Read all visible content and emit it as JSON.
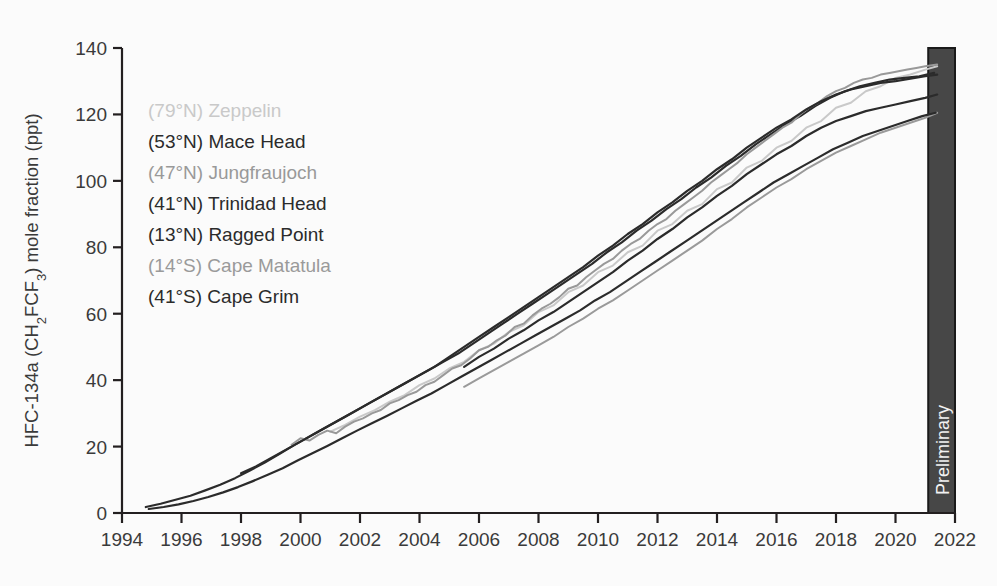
{
  "chart_data": {
    "type": "line",
    "title": "",
    "xlabel": "",
    "ylabel": "HFC-134a (CH2FCF3) mole fraction (ppt)",
    "ylabel_parts": {
      "prefix": "HFC-134a (CH",
      "sub1": "2",
      "mid": "FCF",
      "sub2": "3",
      "suffix": ") mole fraction (ppt)"
    },
    "xlim": [
      1994,
      2022
    ],
    "ylim": [
      0,
      140
    ],
    "grid": false,
    "legend_position": "upper-left-inside",
    "xticks": [
      1994,
      1996,
      1998,
      2000,
      2002,
      2004,
      2006,
      2008,
      2010,
      2012,
      2014,
      2016,
      2018,
      2020,
      2022
    ],
    "yticks": [
      0,
      20,
      40,
      60,
      80,
      100,
      120,
      140
    ],
    "annotations": [
      {
        "name": "preliminary-band",
        "label": "Preliminary",
        "x_start": 2021.1,
        "x_end": 2022.0,
        "color": "#474747",
        "text_color": "#f2f2f2",
        "orientation": "vertical"
      }
    ],
    "series": [
      {
        "name": "Zeppelin",
        "latitude_label": "(79°N)",
        "legend_label": "(79°N) Zeppelin",
        "color": "#c9c9c9",
        "stroke_width": 2.0,
        "x": [
          2001.0,
          2001.5,
          2002.0,
          2002.5,
          2003.0,
          2003.5,
          2004.0,
          2004.5,
          2005.0,
          2005.5,
          2006.0,
          2006.5,
          2007.0,
          2007.5,
          2008.0,
          2008.5,
          2009.0,
          2009.5,
          2010.0,
          2010.5,
          2011.0,
          2011.5,
          2012.0,
          2012.5,
          2013.0,
          2013.5,
          2014.0,
          2014.5,
          2015.0,
          2015.5,
          2016.0,
          2016.5,
          2017.0,
          2017.5,
          2018.0,
          2018.5,
          2019.0,
          2019.5,
          2020.0,
          2020.5,
          2021.0,
          2021.4
        ],
        "y": [
          24.5,
          26.5,
          29.0,
          31.0,
          33.5,
          35.5,
          38.5,
          40.5,
          43.5,
          45.5,
          49.0,
          51.0,
          54.5,
          56.5,
          60.5,
          62.5,
          66.5,
          68.5,
          72.5,
          74.5,
          78.5,
          80.5,
          85.0,
          87.0,
          91.0,
          93.0,
          97.5,
          99.5,
          104.0,
          106.0,
          110.0,
          112.0,
          116.0,
          118.0,
          122.0,
          123.5,
          127.0,
          128.5,
          131.0,
          132.0,
          133.5,
          134.5
        ]
      },
      {
        "name": "Mace Head",
        "latitude_label": "(53°N)",
        "legend_label": "(53°N) Mace Head",
        "color": "#2b2b2b",
        "stroke_width": 2.2,
        "x": [
          1994.8,
          1995.3,
          1995.8,
          1996.3,
          1996.8,
          1997.3,
          1997.8,
          1998.3,
          1998.8,
          1999.3,
          1999.8,
          2000.3,
          2000.8,
          2001.3,
          2001.8,
          2002.3,
          2002.8,
          2003.3,
          2003.8,
          2004.3,
          2004.8,
          2005.3,
          2005.8,
          2006.3,
          2006.8,
          2007.3,
          2007.8,
          2008.3,
          2008.8,
          2009.3,
          2009.8,
          2010.3,
          2010.8,
          2011.3,
          2011.8,
          2012.3,
          2012.8,
          2013.3,
          2013.8,
          2014.3,
          2014.8,
          2015.3,
          2015.8,
          2016.3,
          2016.8,
          2017.3,
          2017.8,
          2018.3,
          2018.8,
          2019.3,
          2019.8,
          2020.3,
          2020.8,
          2021.3
        ],
        "y": [
          1.8,
          2.8,
          4.0,
          5.2,
          6.8,
          8.5,
          10.5,
          12.8,
          15.2,
          17.8,
          20.5,
          23.0,
          25.5,
          28.0,
          30.5,
          33.0,
          35.5,
          38.0,
          40.5,
          43.0,
          45.5,
          48.0,
          51.0,
          54.0,
          57.0,
          60.0,
          63.0,
          66.0,
          69.0,
          72.0,
          75.0,
          78.5,
          81.5,
          85.0,
          88.0,
          91.5,
          94.5,
          98.0,
          101.0,
          104.5,
          107.5,
          111.0,
          114.0,
          117.0,
          119.5,
          122.5,
          125.0,
          127.0,
          128.5,
          129.5,
          130.5,
          131.0,
          131.5,
          132.5
        ]
      },
      {
        "name": "Jungfraujoch",
        "latitude_label": "(47°N)",
        "legend_label": "(47°N) Jungfraujoch",
        "color": "#999999",
        "stroke_width": 2.0,
        "x": [
          1999.7,
          2000.0,
          2000.3,
          2000.6,
          2000.9,
          2001.2,
          2001.5,
          2001.8,
          2002.1,
          2002.4,
          2002.7,
          2003.0,
          2003.3,
          2003.6,
          2003.9,
          2004.2,
          2004.5,
          2004.8,
          2005.1,
          2005.4,
          2005.7,
          2006.0,
          2006.3,
          2006.6,
          2006.9,
          2007.2,
          2007.5,
          2007.8,
          2008.1,
          2008.4,
          2008.7,
          2009.0,
          2009.3,
          2009.6,
          2009.9,
          2010.2,
          2010.5,
          2010.8,
          2011.1,
          2011.4,
          2011.7,
          2012.0,
          2012.3,
          2012.6,
          2012.9,
          2013.2,
          2013.5,
          2013.8,
          2014.1,
          2014.4,
          2014.7,
          2015.0,
          2015.3,
          2015.6,
          2015.9,
          2016.2,
          2016.5,
          2016.8,
          2017.1,
          2017.4,
          2017.7,
          2018.0,
          2018.3,
          2018.6,
          2018.9,
          2019.2,
          2019.5,
          2019.8,
          2020.1,
          2020.4,
          2020.7,
          2021.0,
          2021.4
        ],
        "y": [
          20.5,
          22.5,
          21.8,
          23.5,
          24.8,
          24.0,
          26.0,
          27.5,
          28.5,
          30.0,
          31.0,
          33.0,
          34.0,
          35.5,
          36.5,
          38.5,
          39.5,
          41.5,
          43.5,
          44.5,
          46.5,
          49.0,
          50.0,
          52.0,
          53.5,
          56.0,
          57.0,
          59.5,
          61.5,
          63.0,
          65.0,
          67.5,
          68.5,
          71.0,
          73.0,
          75.0,
          76.5,
          79.0,
          81.0,
          82.5,
          85.0,
          87.0,
          88.5,
          91.0,
          93.0,
          95.0,
          97.0,
          99.5,
          101.5,
          103.5,
          105.5,
          108.0,
          110.0,
          112.0,
          114.0,
          116.0,
          117.5,
          120.0,
          122.0,
          123.5,
          125.5,
          127.0,
          128.0,
          129.5,
          130.5,
          131.0,
          132.0,
          132.5,
          133.0,
          133.5,
          134.0,
          134.5,
          135.0
        ]
      },
      {
        "name": "Trinidad Head",
        "latitude_label": "(41°N)",
        "legend_label": "(41°N) Trinidad Head",
        "color": "#2b2b2b",
        "stroke_width": 2.2,
        "x": [
          1998.0,
          1998.5,
          1999.0,
          1999.5,
          2000.0,
          2000.5,
          2001.0,
          2001.5,
          2002.0,
          2002.5,
          2003.0,
          2003.5,
          2004.0,
          2004.5,
          2005.0,
          2005.5,
          2006.0,
          2006.5,
          2007.0,
          2007.5,
          2008.0,
          2008.5,
          2009.0,
          2009.5,
          2010.0,
          2010.5,
          2011.0,
          2011.5,
          2012.0,
          2012.5,
          2013.0,
          2013.5,
          2014.0,
          2014.5,
          2015.0,
          2015.5,
          2016.0,
          2016.5,
          2017.0,
          2017.5,
          2018.0,
          2018.5,
          2019.0,
          2019.5,
          2020.0,
          2020.5,
          2021.0,
          2021.4
        ],
        "y": [
          12.0,
          14.0,
          16.5,
          19.0,
          21.5,
          24.0,
          26.5,
          29.0,
          31.5,
          34.0,
          36.5,
          39.0,
          41.5,
          44.0,
          47.0,
          50.0,
          53.0,
          56.0,
          59.0,
          62.0,
          65.0,
          68.0,
          71.0,
          74.0,
          77.5,
          80.5,
          84.0,
          87.0,
          90.5,
          93.5,
          97.0,
          100.0,
          103.5,
          106.5,
          110.0,
          113.0,
          116.0,
          118.5,
          121.5,
          124.0,
          126.0,
          127.5,
          128.5,
          129.5,
          130.0,
          130.8,
          131.5,
          132.0
        ]
      },
      {
        "name": "Ragged Point",
        "latitude_label": "(13°N)",
        "legend_label": "(13°N) Ragged Point",
        "color": "#2b2b2b",
        "stroke_width": 2.2,
        "x": [
          2005.5,
          2006.0,
          2006.5,
          2007.0,
          2007.5,
          2008.0,
          2008.5,
          2009.0,
          2009.5,
          2010.0,
          2010.5,
          2011.0,
          2011.5,
          2012.0,
          2012.5,
          2013.0,
          2013.5,
          2014.0,
          2014.5,
          2015.0,
          2015.5,
          2016.0,
          2016.5,
          2017.0,
          2017.5,
          2018.0,
          2018.5,
          2019.0,
          2019.5,
          2020.0,
          2020.5,
          2021.0,
          2021.4
        ],
        "y": [
          44.0,
          47.0,
          49.5,
          52.5,
          55.0,
          58.0,
          60.5,
          63.5,
          66.5,
          69.5,
          72.5,
          76.0,
          79.0,
          82.5,
          85.5,
          89.0,
          92.0,
          95.5,
          98.5,
          102.0,
          105.0,
          108.0,
          110.5,
          113.5,
          116.0,
          118.0,
          119.5,
          121.0,
          122.0,
          123.0,
          124.0,
          125.0,
          126.0
        ]
      },
      {
        "name": "Cape Matatula",
        "latitude_label": "(14°S)",
        "legend_label": "(14°S) Cape Matatula",
        "color": "#9a9a9a",
        "stroke_width": 2.0,
        "x": [
          2005.5,
          2006.0,
          2006.5,
          2007.0,
          2007.5,
          2008.0,
          2008.5,
          2009.0,
          2009.5,
          2010.0,
          2010.5,
          2011.0,
          2011.5,
          2012.0,
          2012.5,
          2013.0,
          2013.5,
          2014.0,
          2014.5,
          2015.0,
          2015.5,
          2016.0,
          2016.5,
          2017.0,
          2017.5,
          2018.0,
          2018.5,
          2019.0,
          2019.5,
          2020.0,
          2020.5,
          2021.0,
          2021.4
        ],
        "y": [
          38.0,
          40.5,
          43.0,
          45.5,
          48.0,
          50.5,
          53.0,
          56.0,
          58.5,
          61.5,
          64.0,
          67.0,
          70.0,
          73.0,
          76.0,
          79.0,
          82.0,
          85.5,
          88.5,
          92.0,
          95.0,
          98.0,
          100.5,
          103.5,
          106.0,
          108.5,
          110.5,
          112.5,
          114.5,
          116.0,
          117.5,
          119.0,
          120.5
        ]
      },
      {
        "name": "Cape Grim",
        "latitude_label": "(41°S)",
        "legend_label": "(41°S) Cape Grim",
        "color": "#2b2b2b",
        "stroke_width": 2.2,
        "x": [
          1994.9,
          1995.4,
          1995.9,
          1996.4,
          1996.9,
          1997.4,
          1997.9,
          1998.4,
          1998.9,
          1999.4,
          1999.9,
          2000.4,
          2000.9,
          2001.4,
          2001.9,
          2002.4,
          2002.9,
          2003.4,
          2003.9,
          2004.4,
          2004.9,
          2005.4,
          2005.9,
          2006.4,
          2006.9,
          2007.4,
          2007.9,
          2008.4,
          2008.9,
          2009.4,
          2009.9,
          2010.4,
          2010.9,
          2011.4,
          2011.9,
          2012.4,
          2012.9,
          2013.4,
          2013.9,
          2014.4,
          2014.9,
          2015.4,
          2015.9,
          2016.4,
          2016.9,
          2017.4,
          2017.9,
          2018.4,
          2018.9,
          2019.4,
          2019.9,
          2020.4,
          2020.9,
          2021.35
        ],
        "y": [
          1.2,
          1.8,
          2.6,
          3.6,
          4.8,
          6.2,
          7.8,
          9.6,
          11.5,
          13.5,
          15.8,
          18.0,
          20.2,
          22.5,
          24.8,
          27.0,
          29.2,
          31.5,
          33.8,
          36.0,
          38.5,
          41.0,
          43.5,
          46.0,
          48.5,
          51.0,
          53.5,
          56.0,
          58.5,
          61.0,
          64.0,
          66.5,
          69.5,
          72.5,
          75.5,
          78.5,
          81.5,
          84.5,
          87.5,
          90.5,
          93.5,
          96.5,
          99.5,
          102.0,
          104.5,
          107.0,
          109.5,
          111.5,
          113.5,
          115.0,
          116.5,
          118.0,
          119.5,
          120.5
        ]
      }
    ]
  },
  "legend": {
    "items": [
      {
        "label": "(79°N) Zeppelin",
        "color": "#c9c9c9"
      },
      {
        "label": "(53°N) Mace Head",
        "color": "#2b2b2b"
      },
      {
        "label": "(47°N) Jungfraujoch",
        "color": "#999999"
      },
      {
        "label": "(41°N) Trinidad Head",
        "color": "#2b2b2b"
      },
      {
        "label": "(13°N) Ragged Point",
        "color": "#2b2b2b"
      },
      {
        "label": "(14°S) Cape Matatula",
        "color": "#9a9a9a"
      },
      {
        "label": "(41°S) Cape Grim",
        "color": "#2b2b2b"
      }
    ]
  },
  "colors": {
    "background": "#fbfbfb",
    "axis": "#231f20",
    "tick_label": "#3a3a3a",
    "preliminary_fill": "#474747"
  }
}
